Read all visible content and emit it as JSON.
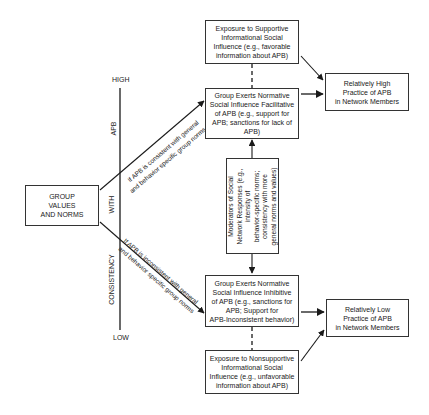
{
  "diagram": {
    "group_box": {
      "lines": [
        "GROUP",
        "VALUES",
        "AND NORMS"
      ]
    },
    "axis": {
      "top_label": "HIGH",
      "bottom_label": "LOW",
      "segments": [
        "APB",
        "WITH",
        "CONSISTENCY"
      ]
    },
    "upper_path": {
      "line1": "If APB is consistent with general",
      "line2": "and behavior specific group norms"
    },
    "lower_path": {
      "line1": "If APB is inconsistent with general",
      "line2": "and behavior specific group norms"
    },
    "supportive_box": {
      "lines": [
        "Exposure to Supportive",
        "Informational Social",
        "Influence (e.g., favorable",
        "information about APB)"
      ]
    },
    "facilitative_box": {
      "lines": [
        "Group Exerts Normative",
        "Social Influence Facilitative",
        "of APB (e.g., support for",
        "APB; sanctions for lack of",
        "APB)"
      ]
    },
    "moderators_box": {
      "lines": [
        "Moderators of Social",
        "Network Responses (e.g.,",
        "intensity of",
        "behavior-specific norms;",
        "consistency with more",
        "general norms and values)"
      ]
    },
    "inhibitive_box": {
      "lines": [
        "Group Exerts Normative",
        "Social Influence Inhibitive",
        "of APB (e.g., sanctions for",
        "APB; Support for",
        "APB-Inconsistent behavior)"
      ]
    },
    "nonsupportive_box": {
      "lines": [
        "Exposure to Nonsupportive",
        "Informational Social",
        "Influence (e.g., unfavorable",
        "information about APB)"
      ]
    },
    "high_outcome_box": {
      "lines": [
        "Relatively High",
        "Practice of APB",
        "in Network Members"
      ]
    },
    "low_outcome_box": {
      "lines": [
        "Relatively Low",
        "Practice of APB",
        "in Network Members"
      ]
    },
    "colors": {
      "line": "#1a1a1a",
      "box_border": "#333333",
      "background": "#ffffff"
    }
  }
}
